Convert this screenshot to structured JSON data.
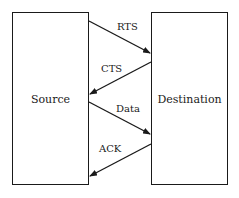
{
  "diagram": {
    "nodes": [
      {
        "id": "source",
        "label": "Source"
      },
      {
        "id": "destination",
        "label": "Destination"
      }
    ],
    "messages": [
      {
        "label": "RTS",
        "from": "source",
        "to": "destination"
      },
      {
        "label": "CTS",
        "from": "destination",
        "to": "source"
      },
      {
        "label": "Data",
        "from": "source",
        "to": "destination"
      },
      {
        "label": "ACK",
        "from": "destination",
        "to": "source"
      }
    ]
  }
}
